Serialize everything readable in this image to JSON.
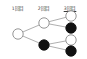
{
  "figure": {
    "background_color": "#ffffff",
    "width": 87,
    "height": 59
  },
  "columns": [
    {
      "label": "1回目",
      "x": 18,
      "y": 6,
      "underlined": false
    },
    {
      "label": "2回目",
      "x": 44,
      "y": 6,
      "underlined": false
    },
    {
      "label": "3回目",
      "x": 70,
      "y": 6,
      "underlined": true
    }
  ],
  "legend": {
    "white_node": "white-ball",
    "black_node": "black-ball"
  },
  "colors": {
    "node_white_fill": "#ffffff",
    "node_black_fill": "#111111",
    "node_stroke": "#8a8a8a",
    "edge_stroke": "#9a9a9a",
    "label_text": "#3a3a3a"
  },
  "chart_data": {
    "type": "diagram",
    "title": "",
    "nodes": [
      {
        "id": "n0",
        "level": 1,
        "x": 18,
        "y": 34,
        "r": 5.2,
        "fill": "white"
      },
      {
        "id": "n1",
        "level": 2,
        "x": 44,
        "y": 23,
        "r": 5.2,
        "fill": "white"
      },
      {
        "id": "n2",
        "level": 2,
        "x": 44,
        "y": 45,
        "r": 5.2,
        "fill": "black"
      },
      {
        "id": "n3",
        "level": 3,
        "x": 71,
        "y": 16,
        "r": 5.2,
        "fill": "white"
      },
      {
        "id": "n4",
        "level": 3,
        "x": 71,
        "y": 28,
        "r": 5.2,
        "fill": "black"
      },
      {
        "id": "n5",
        "level": 3,
        "x": 71,
        "y": 40,
        "r": 5.2,
        "fill": "white"
      },
      {
        "id": "n6",
        "level": 3,
        "x": 71,
        "y": 51,
        "r": 5.2,
        "fill": "black"
      }
    ],
    "edges": [
      {
        "from": "n0",
        "to": "n1"
      },
      {
        "from": "n0",
        "to": "n2"
      },
      {
        "from": "n1",
        "to": "n3"
      },
      {
        "from": "n1",
        "to": "n4"
      },
      {
        "from": "n2",
        "to": "n5"
      },
      {
        "from": "n2",
        "to": "n6"
      }
    ]
  }
}
